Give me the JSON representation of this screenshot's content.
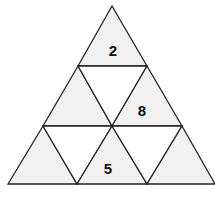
{
  "diagram": {
    "title": "",
    "colors": {
      "shaded": "#f1f1f1",
      "unshaded": "#ffffff",
      "stroke": "#222222"
    },
    "cells": [
      {
        "id": "top",
        "label": "2"
      },
      {
        "id": "row2-left",
        "label": ""
      },
      {
        "id": "row2-middle-inverted",
        "label": ""
      },
      {
        "id": "row2-right",
        "label": "8"
      },
      {
        "id": "row3-left",
        "label": ""
      },
      {
        "id": "row3-inverted-left",
        "label": ""
      },
      {
        "id": "row3-middle",
        "label": "5"
      },
      {
        "id": "row3-inverted-right",
        "label": ""
      },
      {
        "id": "row3-right",
        "label": ""
      }
    ]
  }
}
